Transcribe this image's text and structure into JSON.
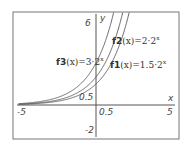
{
  "chart_data": {
    "type": "line",
    "title": "",
    "xlabel": "x",
    "ylabel": "y",
    "xlim": [
      -5,
      5
    ],
    "ylim": [
      -2,
      6
    ],
    "grid": false,
    "x_ticks": [
      "-5",
      "0.5",
      "5"
    ],
    "y_ticks": [
      "6",
      "0.5",
      "-2"
    ],
    "series": [
      {
        "name": "f1",
        "formula": "f1(x)=1.5·2^x",
        "a": 1.5,
        "base": 2
      },
      {
        "name": "f2",
        "formula": "f2(x)=2·2^x",
        "a": 2,
        "base": 2
      },
      {
        "name": "f3",
        "formula": "f3(x)=3·2^x",
        "a": 3,
        "base": 2
      }
    ],
    "labels": {
      "f1": {
        "name": "f1",
        "arg": "(x)",
        "rhs": "=1.5·2",
        "exp": "x"
      },
      "f2": {
        "name": "f2",
        "arg": "(x)",
        "rhs": "=2·2",
        "exp": "x"
      },
      "f3": {
        "name": "f3",
        "arg": "(x)",
        "rhs": "=3·2",
        "exp": "x"
      }
    }
  }
}
